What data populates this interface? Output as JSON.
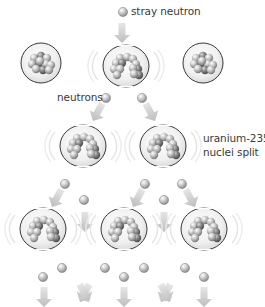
{
  "diagram": {
    "labels": {
      "stray_neutron": "stray neutron",
      "neutrons": "neutrons",
      "nuclei_split_line1": "uranium-235",
      "nuclei_split_line2": "nuclei split"
    },
    "colors": {
      "arrow": "#c9c9c9",
      "nucleus_outline": "#3a3a3a",
      "nucleus_fill": "#eeeeee",
      "neutron": "#bdbdbd",
      "text": "#3a3a3a"
    },
    "rows": [
      {
        "name": "row-1",
        "nuclei": [
          {
            "x": 41,
            "y": 63,
            "state": "intact"
          },
          {
            "x": 126,
            "y": 66,
            "state": "splitting"
          },
          {
            "x": 203,
            "y": 63,
            "state": "intact"
          }
        ]
      },
      {
        "name": "row-2",
        "nuclei": [
          {
            "x": 83,
            "y": 146,
            "state": "splitting"
          },
          {
            "x": 163,
            "y": 146,
            "state": "splitting"
          }
        ]
      },
      {
        "name": "row-3",
        "nuclei": [
          {
            "x": 43,
            "y": 229,
            "state": "splitting"
          },
          {
            "x": 124,
            "y": 229,
            "state": "splitting"
          },
          {
            "x": 204,
            "y": 229,
            "state": "splitting"
          }
        ]
      }
    ]
  }
}
